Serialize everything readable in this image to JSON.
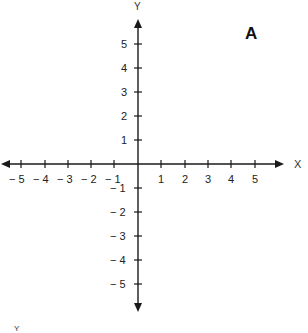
{
  "panel_label": "A",
  "axes": {
    "x_label": "X",
    "y_label": "Y",
    "bottom_fragment": "Y"
  },
  "x_ticks": {
    "neg5": "− 5",
    "neg4": "− 4",
    "neg3": "− 3",
    "neg2": "− 2",
    "neg1": "− 1",
    "pos1": "1",
    "pos2": "2",
    "pos3": "3",
    "pos4": "4",
    "pos5": "5"
  },
  "y_ticks": {
    "pos5": "5",
    "pos4": "4",
    "pos3": "3",
    "pos2": "2",
    "pos1": "1",
    "neg1": "− 1",
    "neg2": "− 2",
    "neg3": "− 3",
    "neg4": "− 4",
    "neg5": "− 5"
  },
  "colors": {
    "axis": "#1a1a1a",
    "background": "#ffffff"
  }
}
